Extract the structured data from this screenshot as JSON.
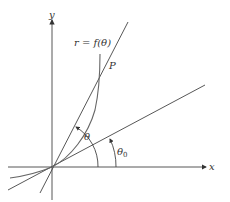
{
  "diagram": {
    "type": "polar-curve-tangent",
    "axes": {
      "x_label": "x",
      "y_label": "y"
    },
    "curve_label": "r = f(θ)",
    "point_label": "P",
    "angles": {
      "theta": "θ",
      "theta0_base": "θ",
      "theta0_sub": "0"
    },
    "colors": {
      "line": "#444444",
      "curve": "#666666",
      "text": "#333333",
      "background": "#ffffff"
    }
  }
}
